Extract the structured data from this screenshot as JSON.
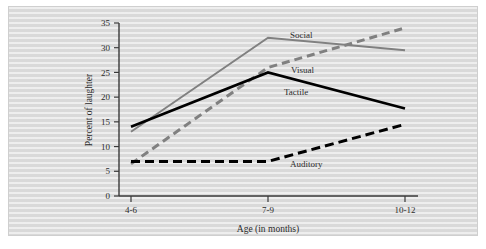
{
  "chart_data": {
    "type": "line",
    "title": "",
    "xlabel": "Age (in months)",
    "ylabel": "Percent of laughter",
    "categories": [
      "4-6",
      "7-9",
      "10-12"
    ],
    "ylim": [
      0,
      35
    ],
    "yticks": [
      0,
      5,
      10,
      15,
      20,
      25,
      30,
      35
    ],
    "grid": false,
    "legend_position": "inline-labels",
    "series": [
      {
        "name": "Social",
        "values": [
          13,
          32,
          29.5
        ],
        "color": "#808080",
        "style": "solid",
        "label": "Social"
      },
      {
        "name": "Visual",
        "values": [
          6.5,
          26,
          34
        ],
        "color": "#808080",
        "style": "dashed",
        "label": "Visual"
      },
      {
        "name": "Tactile",
        "values": [
          14,
          25,
          17.7
        ],
        "color": "#000000",
        "style": "solid",
        "label": "Tactile"
      },
      {
        "name": "Auditory",
        "values": [
          7,
          7,
          14.5
        ],
        "color": "#000000",
        "style": "dashed",
        "label": "Auditory"
      }
    ]
  },
  "axis": {
    "y_tick_labels": [
      "0",
      "5",
      "10",
      "15",
      "20",
      "25",
      "30",
      "35"
    ],
    "x_tick_labels": [
      "4-6",
      "7-9",
      "10-12"
    ],
    "y_title": "Percent of laughter",
    "x_title": "Age (in months)"
  },
  "series_labels": {
    "social": "Social",
    "visual": "Visual",
    "tactile": "Tactile",
    "auditory": "Auditory"
  }
}
